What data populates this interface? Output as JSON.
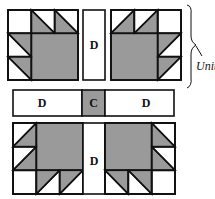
{
  "diagram": {
    "colors": {
      "gray": "#9a9a9a",
      "white": "#ffffff",
      "line": "#111111"
    },
    "labels": {
      "top_strip": "D",
      "middle_left": "D",
      "middle_center": "C",
      "middle_right": "D",
      "bottom_strip": "D",
      "unit": "Unit"
    },
    "blocks": [
      {
        "name": "top-left-block",
        "orientation": "claws top and left"
      },
      {
        "name": "top-right-block",
        "orientation": "claws top and right"
      },
      {
        "name": "bottom-left-block",
        "orientation": "claws left and bottom"
      },
      {
        "name": "bottom-right-block",
        "orientation": "claws right and bottom"
      }
    ]
  }
}
